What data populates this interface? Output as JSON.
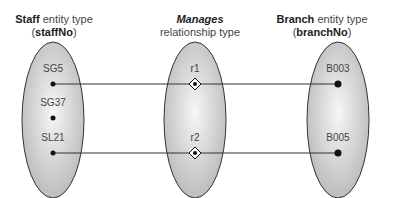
{
  "titles": {
    "left": {
      "bold": "Staff",
      "rest": " entity type",
      "line2_bold": "staffNo"
    },
    "middle": {
      "italic_bold": "Manages",
      "line2": "relationship type"
    },
    "right": {
      "bold": "Branch",
      "rest": " entity type",
      "line2_bold": "branchNo"
    }
  },
  "staff": [
    "SG5",
    "SG37",
    "SL21"
  ],
  "relationships": [
    "r1",
    "r2"
  ],
  "branches": [
    "B003",
    "B005"
  ],
  "links": [
    {
      "staff": "SG5",
      "rel": "r1",
      "branch": "B003"
    },
    {
      "staff": "SL21",
      "rel": "r2",
      "branch": "B005"
    }
  ]
}
